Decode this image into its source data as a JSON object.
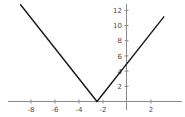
{
  "chart_data": {
    "type": "line",
    "title": "",
    "subtitle": "",
    "xlabel": "",
    "ylabel": "",
    "xlim": [
      -9.6,
      3.5
    ],
    "ylim": [
      -1.2,
      13.0
    ],
    "grid": false,
    "legend": null,
    "axis_color": "#8a8a8a",
    "line_color": "#1a1a1a",
    "background_color": "#ffffff",
    "xticks": [
      -8,
      -6,
      -4,
      -2,
      2
    ],
    "xtick_labels": [
      "-8",
      "-6",
      "-4",
      "-2",
      "2"
    ],
    "yticks": [
      2,
      4,
      6,
      8,
      10,
      12
    ],
    "ytick_labels": [
      "2",
      "4",
      "6",
      "8",
      "10",
      "12"
    ],
    "series": [
      {
        "name": "y = 2|x + 2.5|",
        "vertex": [
          -2.5,
          0
        ],
        "y_intercept": 5,
        "left_slope": -2,
        "right_slope": 2,
        "x": [
          -8.9,
          -2.5,
          3.1
        ],
        "y": [
          12.8,
          0,
          11.2
        ]
      }
    ]
  },
  "axes": {
    "x_axis_name": "x-axis",
    "y_axis_name": "y-axis"
  }
}
